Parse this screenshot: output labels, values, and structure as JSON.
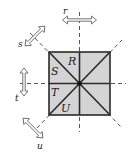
{
  "diagram": {
    "regions": [
      {
        "id": "R",
        "label": "R"
      },
      {
        "id": "S",
        "label": "S"
      },
      {
        "id": "T",
        "label": "T"
      },
      {
        "id": "U",
        "label": "U"
      }
    ],
    "axes": [
      {
        "id": "r",
        "label": "r",
        "orientation": "vertical",
        "arrow": "horizontal"
      },
      {
        "id": "s",
        "label": "s",
        "orientation": "diagonal-down-right",
        "arrow": "diagonal-up-right"
      },
      {
        "id": "t",
        "label": "t",
        "orientation": "horizontal",
        "arrow": "vertical"
      },
      {
        "id": "u",
        "label": "u",
        "orientation": "diagonal-up-right",
        "arrow": "diagonal-down-right"
      }
    ],
    "colors": {
      "square_fill": "#d4d4d4",
      "stroke": "#2a2a2a",
      "dashed": "#555555",
      "arrow_stroke": "#666666"
    }
  }
}
